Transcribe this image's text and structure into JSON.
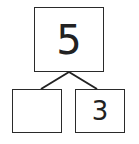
{
  "number_bond": {
    "whole": "5",
    "parts": [
      {
        "position": "left",
        "value": ""
      },
      {
        "position": "right",
        "value": "3"
      }
    ]
  }
}
